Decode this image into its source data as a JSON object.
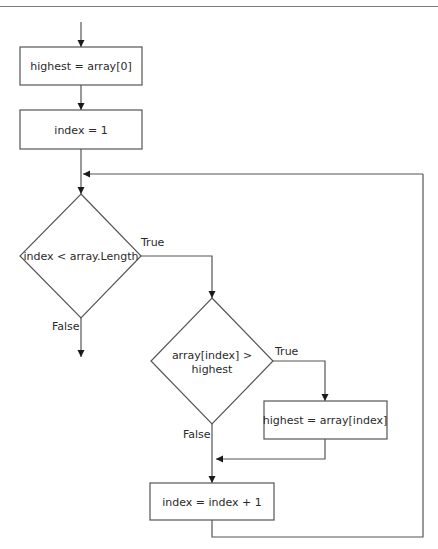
{
  "diagram": {
    "type": "flowchart",
    "colors": {
      "stroke": "#555555",
      "text": "#2a2a2a",
      "background": "#ffffff"
    },
    "nodes": {
      "init_highest": {
        "shape": "rect",
        "text": "highest = array[0]"
      },
      "init_index": {
        "shape": "rect",
        "text": "index = 1"
      },
      "loop_check": {
        "shape": "diamond",
        "text": "index < array.Length"
      },
      "compare": {
        "shape": "diamond",
        "line1": "array[index] >",
        "line2": "highest"
      },
      "update_highest": {
        "shape": "rect",
        "text": "highest = array[index]"
      },
      "increment": {
        "shape": "rect",
        "text": "index = index + 1"
      }
    },
    "edges": {
      "loop_true": "True",
      "loop_false": "False",
      "compare_true": "True",
      "compare_false": "False"
    }
  }
}
